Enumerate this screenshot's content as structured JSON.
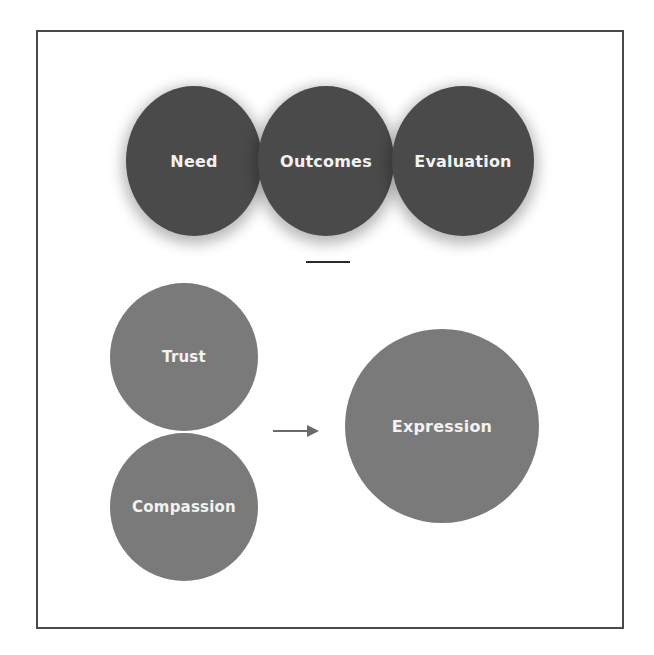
{
  "diagram": {
    "top_row": {
      "circles": [
        {
          "label": "Need"
        },
        {
          "label": "Outcomes"
        },
        {
          "label": "Evaluation"
        }
      ],
      "fill_color": "#4a4a4a"
    },
    "separator": {
      "type": "horizontal-line"
    },
    "bottom_section": {
      "inputs": [
        {
          "label": "Trust"
        },
        {
          "label": "Compassion"
        }
      ],
      "connector": {
        "type": "arrow",
        "direction": "right",
        "icon": "arrow-right-icon"
      },
      "output": {
        "label": "Expression"
      },
      "fill_color": "#7a7a7a"
    },
    "text_color": "#f2f2f2",
    "frame_color": "#4a4a4a"
  }
}
